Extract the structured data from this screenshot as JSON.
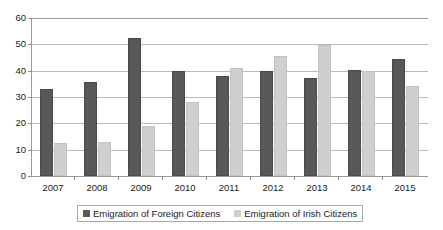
{
  "chart_data": {
    "type": "bar",
    "title": "",
    "subtitle": "",
    "xlabel": "",
    "ylabel": "",
    "categories": [
      "2007",
      "2008",
      "2009",
      "2010",
      "2011",
      "2012",
      "2013",
      "2014",
      "2015"
    ],
    "series": [
      {
        "name": "Emigration of Foreign Citizens",
        "color": "#585858",
        "values": [
          33.2,
          35.6,
          52.4,
          39.8,
          38.1,
          40.0,
          37.3,
          40.3,
          44.3
        ]
      },
      {
        "name": "Emigration of Irish Citizens",
        "color": "#cfcfcf",
        "values": [
          12.7,
          12.8,
          18.9,
          28.2,
          41.2,
          45.7,
          49.8,
          39.8,
          34.0
        ]
      }
    ],
    "ylim": [
      0,
      60
    ],
    "ytick_values": [
      0,
      10,
      20,
      30,
      40,
      50,
      60
    ],
    "ytick_labels": [
      "0",
      "10",
      "20",
      "30",
      "40",
      "50",
      "60"
    ],
    "grid": "horizontal",
    "legend_position": "bottom",
    "annotations": []
  },
  "legend": {
    "entries": [
      {
        "label": "Emigration of Foreign Citizens",
        "swatch": "dark-gray-swatch"
      },
      {
        "label": "Emigration of Irish Citizens",
        "swatch": "light-gray-swatch"
      }
    ]
  },
  "colors": {
    "series_foreign": "#585858",
    "series_irish": "#cfcfcf",
    "gridline": "#b9b9b9",
    "axis": "#9a9a9a",
    "text": "#1a1a1a",
    "background": "#ffffff"
  }
}
